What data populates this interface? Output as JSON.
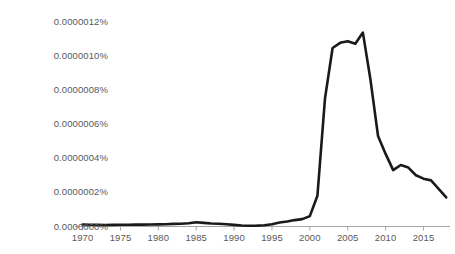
{
  "chart_data": {
    "type": "line",
    "title": "",
    "xlabel": "",
    "ylabel": "",
    "xlim": [
      1969,
      2018.5
    ],
    "ylim": [
      0,
      1.2e-06
    ],
    "grid": false,
    "legend": null,
    "y_unit": "percent",
    "y_ticks": [
      0.0,
      2e-07,
      4e-07,
      6e-07,
      8e-07,
      1e-06,
      1.2e-06
    ],
    "y_tick_labels": [
      "0.0000000%",
      "0.0000002%",
      "0.0000004%",
      "0.0000006%",
      "0.0000008%",
      "0.0000010%",
      "0.0000012%"
    ],
    "x_ticks": [
      1970,
      1975,
      1980,
      1985,
      1990,
      1995,
      2000,
      2005,
      2010,
      2015
    ],
    "x_tick_labels": [
      "1970",
      "1975",
      "1980",
      "1985",
      "1990",
      "1995",
      "2000",
      "2005",
      "2010",
      "2015"
    ],
    "line_color": "#1a1a1a",
    "line_width": 2.6,
    "axis_color": "#a6a6a6",
    "series": [
      {
        "name": "frequency",
        "x": [
          1970,
          1971,
          1972,
          1973,
          1974,
          1975,
          1976,
          1977,
          1978,
          1979,
          1980,
          1981,
          1982,
          1983,
          1984,
          1985,
          1986,
          1987,
          1988,
          1989,
          1990,
          1991,
          1992,
          1993,
          1994,
          1995,
          1996,
          1997,
          1998,
          1999,
          2000,
          2001,
          2002,
          2003,
          2004,
          2005,
          2006,
          2007,
          2008,
          2009,
          2010,
          2011,
          2012,
          2013,
          2014,
          2015,
          2016,
          2017,
          2018
        ],
        "values": [
          1.17e-08,
          1.05e-08,
          9.4e-09,
          8.8e-09,
          9.4e-09,
          1e-08,
          1.05e-08,
          1.11e-08,
          1.11e-08,
          1.17e-08,
          1.23e-08,
          1.29e-08,
          1.52e-08,
          1.64e-08,
          1.93e-08,
          2.52e-08,
          2.11e-08,
          1.76e-08,
          1.64e-08,
          1.35e-08,
          9.4e-09,
          5.9e-09,
          4.7e-09,
          5.3e-09,
          7.6e-09,
          1.29e-08,
          2.34e-08,
          2.93e-08,
          3.75e-08,
          4.34e-08,
          6.09e-08,
          1.8e-07,
          7.5e-07,
          1.045e-06,
          1.075e-06,
          1.085e-06,
          1.07e-06,
          1.135e-06,
          8.6e-07,
          5.3e-07,
          4.25e-07,
          3.3e-07,
          3.6e-07,
          3.45e-07,
          3e-07,
          2.8e-07,
          2.7e-07,
          2.2e-07,
          1.7e-07
        ]
      }
    ]
  }
}
